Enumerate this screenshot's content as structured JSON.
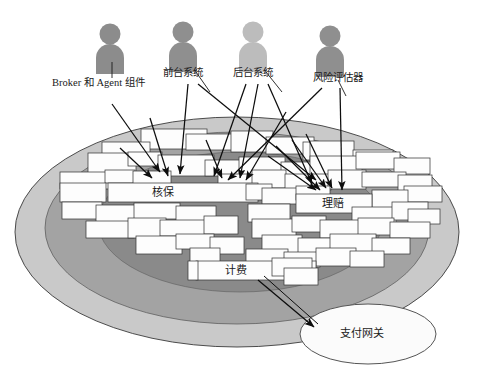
{
  "diagram": {
    "title_present": false,
    "background_color": "#ffffff",
    "outline_color": "#2b2b2b",
    "rings": [
      {
        "name": "outer-ring",
        "fill": "#c9c9c9",
        "cx": 237,
        "cy": 232,
        "rx": 222,
        "ry": 115
      },
      {
        "name": "middle-ring",
        "fill": "#a3a3a3",
        "cx": 237,
        "cy": 228,
        "rx": 192,
        "ry": 96
      },
      {
        "name": "inner-core",
        "fill": "#8a8a8a",
        "cx": 240,
        "cy": 222,
        "rx": 142,
        "ry": 70
      }
    ],
    "actors": [
      {
        "id": "broker-agent",
        "label": "Broker 和 Agent 组件",
        "color": "#8c8c8c",
        "figure_x": 110,
        "figure_y": 24,
        "label_x": 52,
        "label_y": 84
      },
      {
        "id": "front-office",
        "label": "前台系统",
        "color": "#8f8f8f",
        "figure_x": 183,
        "figure_y": 22,
        "label_x": 163,
        "label_y": 74
      },
      {
        "id": "back-office",
        "label": "后台系统",
        "color": "#bcbcbc",
        "figure_x": 253,
        "figure_y": 22,
        "label_x": 233,
        "label_y": 74
      },
      {
        "id": "risk-assessor",
        "label": "风险评估器",
        "color": "#8f8f8f",
        "figure_x": 330,
        "figure_y": 26,
        "label_x": 313,
        "label_y": 80
      }
    ],
    "domains": [
      {
        "id": "underwriting",
        "label": "核保",
        "x": 152,
        "y": 190
      },
      {
        "id": "claims",
        "label": "理赔",
        "x": 322,
        "y": 202
      },
      {
        "id": "billing",
        "label": "计费",
        "x": 225,
        "y": 268
      }
    ],
    "external_system": {
      "id": "payment-gateway",
      "label": "支付网关",
      "cx": 368,
      "cy": 334,
      "rx": 68,
      "ry": 30,
      "fill": "#fbfbfb",
      "stroke": "#555555"
    },
    "component_box": {
      "fill": "#fdfdfd",
      "stroke": "#3a3a3a",
      "count": 78
    },
    "arrows": {
      "stroke": "#111111",
      "count": 14,
      "connections": [
        {
          "from": "broker-agent",
          "to": "underwriting-cluster"
        },
        {
          "from": "front-office",
          "to": "underwriting-cluster"
        },
        {
          "from": "front-office",
          "to": "claims-cluster"
        },
        {
          "from": "back-office",
          "to": "underwriting-cluster"
        },
        {
          "from": "back-office",
          "to": "claims-cluster"
        },
        {
          "from": "risk-assessor",
          "to": "claims-cluster"
        },
        {
          "from": "billing",
          "to": "payment-gateway"
        }
      ]
    }
  }
}
